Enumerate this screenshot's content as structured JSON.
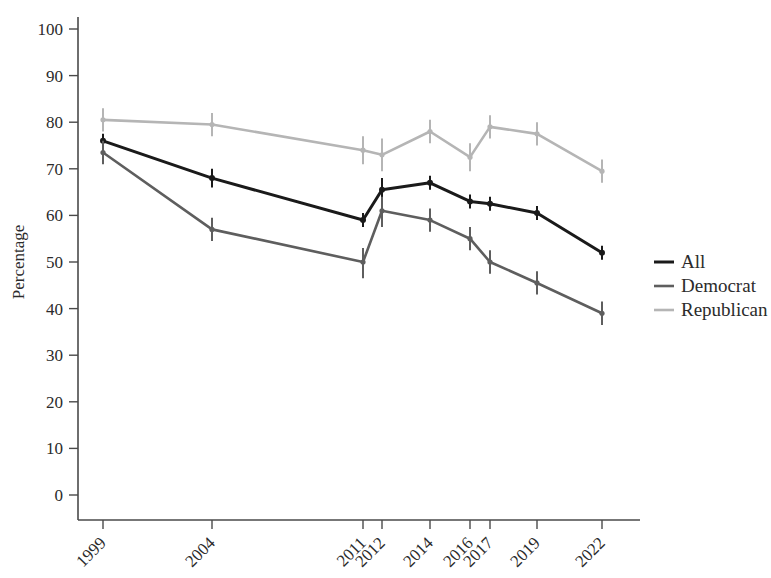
{
  "chart_data": {
    "type": "line",
    "title": "",
    "xlabel": "",
    "ylabel": "Percentage",
    "categories": [
      "1999",
      "2004",
      "2011",
      "2012",
      "2014",
      "2016",
      "2017",
      "2019",
      "2022"
    ],
    "ylim": [
      0,
      100
    ],
    "yticks": [
      0,
      10,
      20,
      30,
      40,
      50,
      60,
      70,
      80,
      90,
      100
    ],
    "grid": false,
    "legend_position": "right",
    "error_bars": true,
    "series": [
      {
        "name": "All",
        "color": "#1a1a1a",
        "values": [
          76,
          68,
          59,
          65.5,
          67,
          63,
          62.5,
          60.5,
          52
        ],
        "err_low": [
          74.5,
          66,
          57.5,
          63.5,
          65.5,
          61.5,
          61,
          59,
          50.5
        ],
        "err_high": [
          77.5,
          70,
          60.5,
          68,
          68.5,
          64.5,
          64,
          62,
          53.5
        ]
      },
      {
        "name": "Democrat",
        "color": "#5e5e5e",
        "values": [
          73.5,
          57,
          50,
          61,
          59,
          55,
          50,
          45.5,
          39
        ],
        "err_low": [
          71,
          54.5,
          46.5,
          57.5,
          56.5,
          52.5,
          47.5,
          43,
          36.5
        ],
        "err_high": [
          76,
          59.5,
          53,
          64,
          61.5,
          57.5,
          52.5,
          48,
          41.5
        ]
      },
      {
        "name": "Republican",
        "color": "#b5b5b5",
        "values": [
          80.5,
          79.5,
          74,
          73,
          78,
          72.5,
          79,
          77.5,
          69.5
        ],
        "err_low": [
          78,
          77,
          71,
          69.5,
          75.5,
          69.5,
          76.5,
          75,
          67
        ],
        "err_high": [
          83,
          82,
          77,
          76.5,
          80.5,
          75.5,
          81.5,
          80,
          72
        ]
      }
    ],
    "legend": [
      {
        "label": "All",
        "color": "#1a1a1a"
      },
      {
        "label": "Democrat",
        "color": "#5e5e5e"
      },
      {
        "label": "Republican",
        "color": "#b5b5b5"
      }
    ]
  }
}
